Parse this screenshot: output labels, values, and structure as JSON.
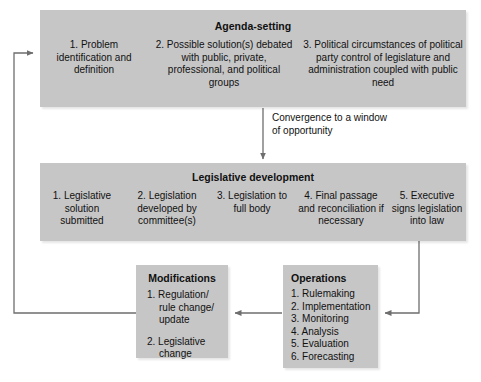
{
  "diagram": {
    "colors": {
      "box_fill": "#c6c6c6",
      "line": "#6e6e6e",
      "text": "#111111",
      "background": "#ffffff"
    }
  },
  "agenda": {
    "title": "Agenda-setting",
    "columns": [
      {
        "label": "1. Problem identification and definition"
      },
      {
        "label": "2. Possible solution(s) debated with public, private, professional, and political groups"
      },
      {
        "label": "3. Political circumstances of political party control of legislature and administration coupled with public need"
      }
    ]
  },
  "convergence": {
    "label": "Convergence to a window of opportunity"
  },
  "legislative": {
    "title": "Legislative development",
    "columns": [
      {
        "label": "1. Legislative solution submitted"
      },
      {
        "label": "2. Legislation developed by committee(s)"
      },
      {
        "label": "3. Legislation to full body"
      },
      {
        "label": "4. Final passage and reconciliation if necessary"
      },
      {
        "label": "5. Executive signs legislation into law"
      }
    ]
  },
  "modifications": {
    "title": "Modifications",
    "items": [
      "1. Regulation/ rule change/ update",
      "2. Legislative change"
    ]
  },
  "operations": {
    "title": "Operations",
    "items": [
      "1. Rulemaking",
      "2. Implementation",
      "3. Monitoring",
      "4. Analysis",
      "5. Evaluation",
      "6. Forecasting"
    ]
  },
  "connectors": [
    {
      "name": "agenda-to-legislative-arrow"
    },
    {
      "name": "legislative-to-operations-arrow"
    },
    {
      "name": "operations-to-modifications-arrow"
    },
    {
      "name": "modifications-to-agenda-feedback-arrow"
    }
  ]
}
